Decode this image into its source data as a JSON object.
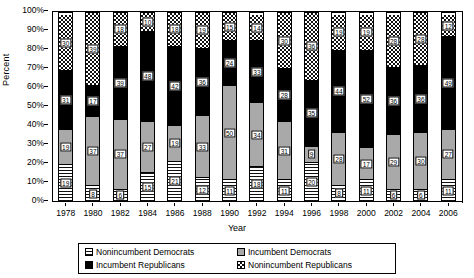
{
  "chart_data": {
    "type": "bar",
    "stacked": true,
    "normalized_percent": true,
    "title": "",
    "xlabel": "Year",
    "ylabel": "Percent",
    "ylim": [
      0,
      100
    ],
    "ytick_labels": [
      "0%",
      "10%",
      "20%",
      "30%",
      "40%",
      "50%",
      "60%",
      "70%",
      "80%",
      "90%",
      "100%"
    ],
    "ytick_values": [
      0,
      10,
      20,
      30,
      40,
      50,
      60,
      70,
      80,
      90,
      100
    ],
    "grid": false,
    "legend_position": "bottom",
    "categories": [
      1978,
      1980,
      1982,
      1984,
      1986,
      1988,
      1990,
      1992,
      1994,
      1996,
      1998,
      2000,
      2002,
      2004,
      2006
    ],
    "series": [
      {
        "name": "Nonincumbent Democrats",
        "fill": "horizontal-stripes",
        "values": [
          19,
          8,
          6,
          15,
          21,
          12,
          11,
          18,
          11,
          20,
          8,
          11,
          6,
          6,
          11
        ]
      },
      {
        "name": "Incumbent Democrats",
        "fill": "solid-gray",
        "values": [
          19,
          37,
          37,
          27,
          19,
          33,
          50,
          34,
          31,
          9,
          28,
          17,
          29,
          30,
          27
        ]
      },
      {
        "name": "Incumbent Republicans",
        "fill": "solid-black",
        "values": [
          31,
          17,
          39,
          48,
          42,
          36,
          24,
          33,
          28,
          35,
          44,
          52,
          36,
          36,
          49
        ]
      },
      {
        "name": "Nonincumbent Republicans",
        "fill": "checkerboard",
        "values": [
          30,
          39,
          18,
          10,
          18,
          19,
          15,
          14,
          30,
          36,
          19,
          19,
          28,
          28,
          12
        ]
      }
    ]
  },
  "legend": {
    "entries": [
      {
        "label": "Nonincumbent Democrats",
        "swatch": "horizontal-stripes"
      },
      {
        "label": "Incumbent Democrats",
        "swatch": "solid-gray"
      },
      {
        "label": "Incumbent Republicans",
        "swatch": "solid-black"
      },
      {
        "label": "Nonincumbent Republicans",
        "swatch": "checkerboard"
      }
    ]
  },
  "axes": {
    "y_title": "Percent",
    "x_title": "Year"
  }
}
